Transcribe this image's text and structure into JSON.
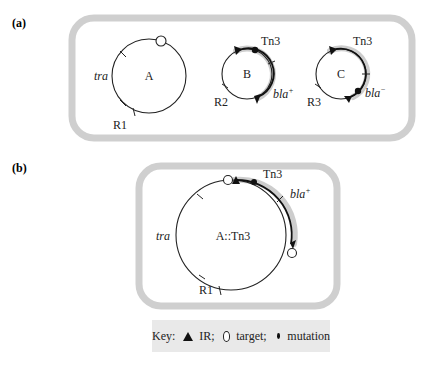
{
  "panels": {
    "a": {
      "label": "(a)",
      "plasmids": [
        {
          "name": "A",
          "labels": {
            "gene": "tra",
            "resistance": "R1"
          }
        },
        {
          "name": "B",
          "labels": {
            "transposon": "Tn3",
            "gene": "bla",
            "gene_sup": "+",
            "resistance": "R2"
          }
        },
        {
          "name": "C",
          "labels": {
            "transposon": "Tn3",
            "gene": "bla",
            "gene_sup": "−",
            "resistance": "R3"
          }
        }
      ]
    },
    "b": {
      "label": "(b)",
      "plasmid": {
        "name": "A::Tn3",
        "labels": {
          "transposon": "Tn3",
          "gene": "bla",
          "gene_sup": "+",
          "tra": "tra",
          "resistance": "R1"
        }
      }
    }
  },
  "key": {
    "prefix": "Key:",
    "items": [
      {
        "symbol": "filled-triangle",
        "label": "IR;"
      },
      {
        "symbol": "open-circle",
        "label": "target;"
      },
      {
        "symbol": "filled-dot",
        "label": "mutation"
      }
    ]
  },
  "colors": {
    "cell_outline": "#cfcfcf",
    "transposon_halo": "#cdcdcd",
    "key_background": "#e9e9e9",
    "ink": "#111111"
  }
}
